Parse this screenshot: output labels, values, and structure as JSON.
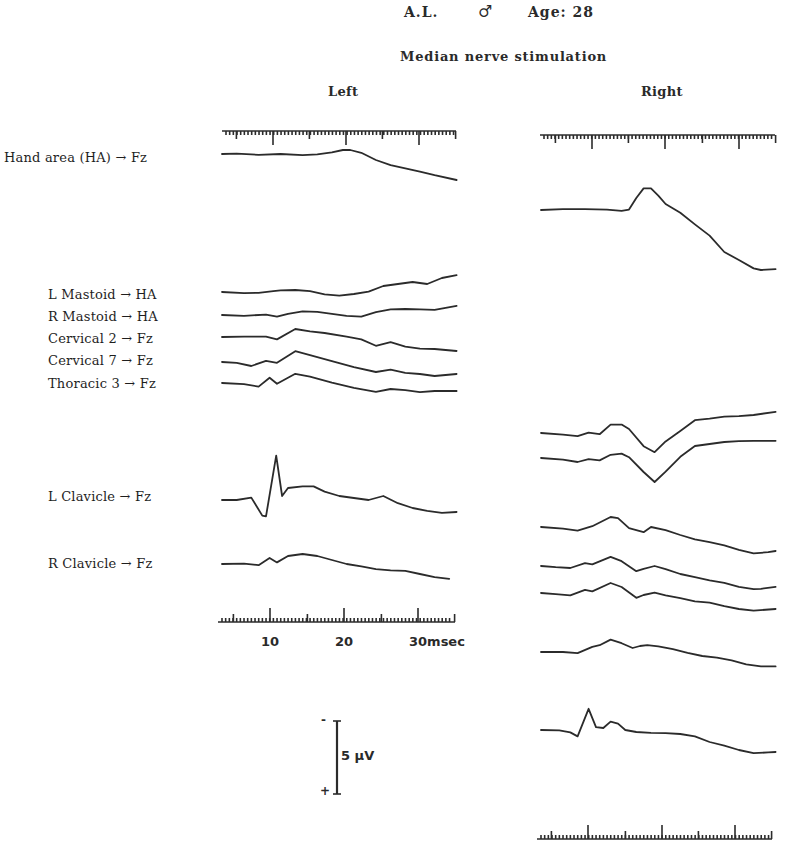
{
  "header": {
    "patient": "A.L.",
    "sex_symbol": "♂",
    "age": "Age: 28",
    "subtitle": "Median nerve stimulation",
    "left_panel": "Left",
    "right_panel": "Right"
  },
  "trace_labels": [
    "Hand area (HA) → Fz",
    "L Mastoid → HA",
    "R Mastoid → HA",
    "Cervical 2 → Fz",
    "Cervical 7 → Fz",
    "Thoracic 3 → Fz",
    "L Clavicle → Fz",
    "R Clavicle → Fz"
  ],
  "time_axis": {
    "ticks": [
      "10",
      "20",
      "30msec"
    ],
    "unit": "msec"
  },
  "scale_bar": {
    "label": "5 µV",
    "top_sign": "-",
    "bottom_sign": "+"
  },
  "chart_data": {
    "type": "line",
    "xlabel": "Latency (msec)",
    "ylabel": "Amplitude (scale bar 5 µV, negative up)",
    "x_ticks": [
      10,
      20,
      30
    ],
    "xlim": [
      3,
      35
    ],
    "grid": false,
    "panels": [
      {
        "name": "Left",
        "series": [
          {
            "name": "Hand area (HA) → Fz",
            "x": [
              3,
              5,
              8,
              11,
              14,
              16,
              18,
              19.5,
              20.5,
              22,
              24,
              26,
              28,
              30,
              32,
              35
            ],
            "y": [
              0,
              0.1,
              -0.2,
              0,
              -0.3,
              -0.1,
              0.4,
              1.0,
              1.0,
              0.3,
              -1.5,
              -2.8,
              -3.6,
              -4.4,
              -5.3,
              -6.5
            ]
          },
          {
            "name": "L Mastoid → HA",
            "x": [
              3,
              6,
              8,
              10,
              11,
              13,
              15,
              17,
              19,
              21,
              23,
              25,
              27,
              29,
              31,
              33,
              35
            ],
            "y": [
              0,
              -0.3,
              -0.2,
              0.2,
              0.4,
              0.5,
              0.2,
              -0.6,
              -0.9,
              -0.5,
              0.1,
              1.5,
              2.0,
              2.5,
              2.0,
              3.5,
              4.2
            ]
          },
          {
            "name": "R Mastoid → HA",
            "x": [
              3,
              6,
              9,
              10.5,
              12,
              14,
              16,
              18,
              20,
              22,
              24,
              26,
              28,
              30,
              32,
              35
            ],
            "y": [
              0,
              -0.2,
              0.1,
              -0.4,
              0.3,
              0.9,
              0.8,
              0.3,
              -0.2,
              -0.4,
              0.7,
              1.4,
              1.5,
              1.4,
              1.3,
              2.3
            ]
          },
          {
            "name": "Cervical 2 → Fz",
            "x": [
              3,
              6,
              9,
              10.5,
              13,
              15,
              17,
              20,
              22,
              24,
              26,
              28,
              30,
              32,
              35
            ],
            "y": [
              0,
              0.1,
              0.1,
              -0.6,
              2.0,
              1.4,
              1.0,
              0.1,
              -0.6,
              -2.2,
              -1.3,
              -2.4,
              -2.9,
              -3.0,
              -3.5
            ]
          },
          {
            "name": "Cervical 7 → Fz",
            "x": [
              3,
              5,
              7,
              9,
              10.5,
              13,
              15,
              18,
              21,
              24,
              26,
              28,
              30,
              32,
              35
            ],
            "y": [
              0,
              -0.2,
              -1.0,
              0.3,
              -0.2,
              2.7,
              1.7,
              0.2,
              -1.3,
              -2.5,
              -1.9,
              -2.7,
              -3.0,
              -3.5,
              -3.0
            ]
          },
          {
            "name": "Thoracic 3 → Fz",
            "x": [
              3,
              6,
              8,
              9.5,
              10.5,
              13,
              15,
              18,
              21,
              24,
              26,
              28,
              30,
              32,
              35
            ],
            "y": [
              0,
              -0.3,
              -0.9,
              1.3,
              -0.2,
              2.3,
              1.6,
              0.1,
              -1.2,
              -2.2,
              -1.5,
              -1.8,
              -2.3,
              -2.0,
              -2.0
            ]
          },
          {
            "name": "L Clavicle → Fz",
            "x": [
              3,
              5,
              7,
              8.5,
              9,
              10.4,
              11.2,
              12,
              14,
              15.5,
              17,
              19,
              21,
              23,
              25,
              27,
              29,
              31,
              33,
              35
            ],
            "y": [
              0,
              0,
              0.6,
              -3.9,
              -4.1,
              11.1,
              1.0,
              3.0,
              3.4,
              3.4,
              2.1,
              1.0,
              0.5,
              0.0,
              1.0,
              -0.8,
              -2.0,
              -2.7,
              -3.2,
              -3.0
            ]
          },
          {
            "name": "R Clavicle → Fz",
            "x": [
              3,
              6,
              8,
              9.5,
              10.5,
              12,
              14,
              16,
              18,
              20,
              22,
              24,
              26,
              28,
              30,
              32,
              34
            ],
            "y": [
              0,
              0.1,
              -0.3,
              1.5,
              0.4,
              2.0,
              2.5,
              2.0,
              1.0,
              0.0,
              -0.6,
              -1.3,
              -1.6,
              -1.7,
              -2.5,
              -3.3,
              -3.7
            ]
          }
        ]
      },
      {
        "name": "Right",
        "series": [
          {
            "name": "Hand area (HA) → Fz",
            "x": [
              3,
              6,
              9,
              12,
              14,
              15,
              16,
              17,
              18,
              19,
              20,
              22,
              24,
              26,
              28,
              30,
              32,
              33,
              35
            ],
            "y": [
              0,
              0.2,
              0.2,
              0.1,
              -0.2,
              0.1,
              3.0,
              5.4,
              5.4,
              3.6,
              1.5,
              -0.7,
              -3.6,
              -6.4,
              -10.5,
              -12.5,
              -14.6,
              -15.0,
              -14.8
            ]
          },
          {
            "name": "L Mastoid → HA",
            "x": [
              3,
              6,
              8,
              9.5,
              11,
              12.5,
              14,
              15,
              17,
              18.5,
              20,
              22,
              24,
              26,
              28,
              30,
              32,
              35
            ],
            "y": [
              0,
              -0.4,
              -0.8,
              0.1,
              -0.3,
              2.1,
              2.1,
              1.0,
              -3.3,
              -4.8,
              -2.1,
              0.5,
              3.2,
              3.6,
              4.1,
              4.2,
              4.5,
              5.3
            ]
          },
          {
            "name": "R Mastoid → HA",
            "x": [
              3,
              6,
              8,
              9.5,
              11,
              12.5,
              14,
              15,
              17,
              18.5,
              20,
              22,
              24,
              26,
              28,
              30,
              32,
              35
            ],
            "y": [
              0,
              -0.4,
              -1.0,
              -0.3,
              -0.6,
              0.8,
              1.1,
              0.2,
              -3.5,
              -6.0,
              -3.4,
              0.3,
              3.0,
              3.5,
              4.0,
              4.2,
              4.3,
              4.3
            ]
          },
          {
            "name": "Cervical 2 → Fz",
            "x": [
              3,
              6,
              8,
              10,
              12.5,
              13.5,
              15,
              17,
              18,
              20,
              22,
              24,
              26,
              28,
              30,
              32,
              34,
              35
            ],
            "y": [
              0,
              -0.4,
              -0.9,
              0.2,
              2.5,
              2.2,
              -0.3,
              -1.3,
              0.0,
              -0.8,
              -2.0,
              -3.1,
              -3.8,
              -4.6,
              -5.7,
              -6.6,
              -6.3,
              -6.0
            ]
          },
          {
            "name": "Cervical 7 → Fz",
            "x": [
              3,
              5,
              7,
              9,
              10,
              12.5,
              14,
              16,
              17,
              18.5,
              20,
              22,
              24,
              26,
              28,
              30,
              32,
              33,
              35
            ],
            "y": [
              0,
              -0.3,
              -0.5,
              0.7,
              0.4,
              2.3,
              1.2,
              -1.3,
              -0.7,
              0.0,
              -0.8,
              -2.0,
              -2.8,
              -3.6,
              -4.2,
              -5.2,
              -5.8,
              -5.7,
              -5.2
            ]
          },
          {
            "name": "Thoracic 3 → Fz",
            "x": [
              3,
              5,
              7,
              9,
              10,
              12.5,
              14,
              16,
              17,
              18.5,
              20,
              22,
              24,
              26,
              28,
              30,
              32,
              35
            ],
            "y": [
              0,
              -0.3,
              -0.6,
              0.8,
              0.4,
              2.5,
              1.5,
              -1.2,
              -0.5,
              0.1,
              -0.6,
              -1.3,
              -2.1,
              -2.4,
              -3.3,
              -4.0,
              -4.4,
              -4.0
            ]
          },
          {
            "name": "L Clavicle → Fz",
            "x": [
              3,
              6,
              8,
              10,
              11,
              12.5,
              14,
              15.5,
              16.5,
              17.5,
              19,
              21,
              23,
              25,
              27,
              29,
              31,
              33,
              35
            ],
            "y": [
              0,
              0,
              -0.3,
              1.3,
              1.7,
              3.1,
              2.2,
              1.0,
              1.5,
              1.7,
              1.4,
              0.7,
              -0.2,
              -1.0,
              -1.4,
              -2.1,
              -3.1,
              -3.6,
              -3.6
            ]
          },
          {
            "name": "R Clavicle → Fz",
            "x": [
              3,
              5.5,
              7,
              8,
              9.5,
              10.5,
              11.5,
              12.5,
              13.5,
              14.5,
              16,
              18,
              20,
              22,
              24,
              26,
              28,
              30,
              32,
              34,
              35
            ],
            "y": [
              0,
              -0.1,
              -0.6,
              -1.6,
              5.3,
              0.7,
              0.5,
              2.1,
              1.6,
              0.0,
              -0.5,
              -0.7,
              -0.8,
              -1.0,
              -1.6,
              -3.0,
              -3.9,
              -5.0,
              -5.8,
              -5.6,
              -5.5
            ]
          }
        ]
      }
    ]
  }
}
